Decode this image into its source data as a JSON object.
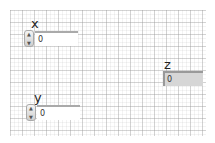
{
  "controls": [
    {
      "label": "x",
      "value": "0"
    },
    {
      "label": "y",
      "value": "0"
    }
  ],
  "indicators": [
    {
      "label": "z",
      "value": "0"
    }
  ]
}
